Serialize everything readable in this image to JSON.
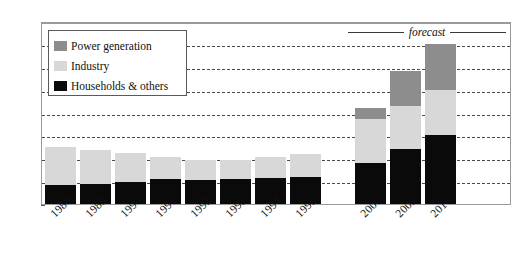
{
  "chart_data": {
    "type": "bar",
    "subtype": "stacked-bar",
    "title": "",
    "xlabel": "",
    "ylabel": "",
    "ylim": [
      0,
      40
    ],
    "yticks": [
      0,
      5,
      10,
      15,
      20,
      25,
      30,
      35,
      40
    ],
    "grid": true,
    "legend_position": "top-left",
    "categories": [
      "1988",
      "1989",
      "1990",
      "1991",
      "1992",
      "1993",
      "1994",
      "1995",
      "2000",
      "2005",
      "2010"
    ],
    "series": [
      {
        "name": "Households & others",
        "color": "#0a0a0a",
        "values": [
          4.2,
          4.3,
          4.8,
          5.5,
          5.3,
          5.5,
          5.7,
          6.0,
          9.0,
          12.0,
          15.0
        ]
      },
      {
        "name": "Industry",
        "color": "#d8d8d8",
        "values": [
          8.2,
          7.6,
          6.4,
          4.8,
          4.3,
          4.1,
          4.5,
          5.0,
          9.5,
          9.5,
          10.0
        ]
      },
      {
        "name": "Power generation",
        "color": "#8d8d8d",
        "values": [
          0,
          0,
          0,
          0,
          0,
          0,
          0,
          0,
          2.5,
          7.5,
          10.0
        ]
      }
    ],
    "totals": [
      12.4,
      11.9,
      11.2,
      10.3,
      9.6,
      9.6,
      10.2,
      11.0,
      21.0,
      29.0,
      35.0
    ],
    "annotations": [
      {
        "text": "forecast",
        "style": "italic",
        "covers": [
          "2000",
          "2005",
          "2010"
        ]
      }
    ],
    "gap_after_category": "1995"
  },
  "legend": {
    "items": [
      {
        "label": "Power generation",
        "color": "#8d8d8d"
      },
      {
        "label": "Industry",
        "color": "#d8d8d8"
      },
      {
        "label": "Households & others",
        "color": "#0a0a0a"
      }
    ]
  },
  "annotation": {
    "forecast_label": "forecast"
  }
}
